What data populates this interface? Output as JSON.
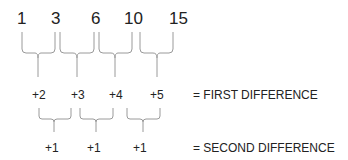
{
  "sequence": {
    "terms": [
      "1",
      "3",
      "6",
      "10",
      "15"
    ]
  },
  "first_difference": {
    "values": [
      "+2",
      "+3",
      "+4",
      "+5"
    ],
    "label": "= FIRST DIFFERENCE"
  },
  "second_difference": {
    "values": [
      "+1",
      "+1",
      "+1"
    ],
    "label": "= SECOND DIFFERENCE"
  },
  "colors": {
    "text": "#222222",
    "brace": "#9a9a9a"
  }
}
